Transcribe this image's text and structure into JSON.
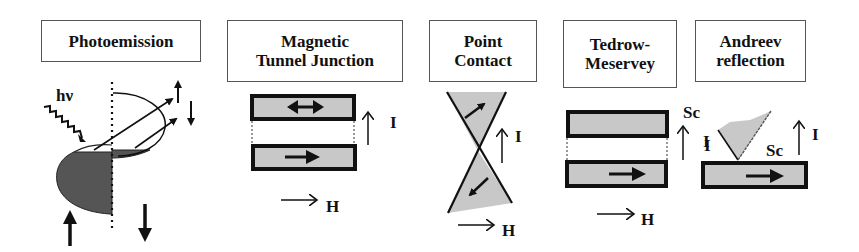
{
  "figure": {
    "panels": [
      {
        "id": "photoemission",
        "title_lines": [
          "Photoemission"
        ],
        "labels": {
          "photon": "hν"
        }
      },
      {
        "id": "magnetic-tunnel-junction",
        "title_lines": [
          "Magnetic",
          "Tunnel Junction"
        ],
        "labels": {
          "current": "I",
          "field": "H"
        }
      },
      {
        "id": "point-contact",
        "title_lines": [
          "Point",
          "Contact"
        ],
        "labels": {
          "current": "I",
          "field": "H"
        }
      },
      {
        "id": "tedrow-meservey",
        "title_lines": [
          "Tedrow-",
          "Meservey"
        ],
        "labels": {
          "superconductor": "Sc",
          "current": "I",
          "field": "H"
        }
      },
      {
        "id": "andreev-reflection",
        "title_lines": [
          "Andreev",
          "reflection"
        ],
        "labels": {
          "current_left": "I",
          "superconductor": "Sc",
          "current": "I"
        }
      }
    ],
    "colors": {
      "layer_fill": "#c8c8c8",
      "layer_border": "#111111",
      "occupied_states": "#555555",
      "ink": "#111111",
      "box_border": "#555555"
    }
  }
}
